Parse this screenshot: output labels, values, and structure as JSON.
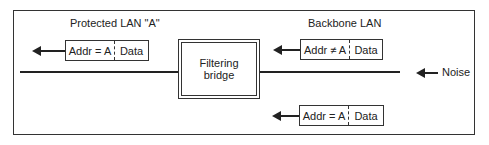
{
  "diagram": {
    "protected_lan_label": "Protected LAN \"A\"",
    "backbone_lan_label": "Backbone LAN",
    "bridge_label_line1": "Filtering",
    "bridge_label_line2": "bridge",
    "noise_label": "Noise",
    "packets": [
      {
        "addr": "Addr = A",
        "data": "Data",
        "location": "protected LAN, top-left"
      },
      {
        "addr": "Addr ≠ A",
        "data": "Data",
        "location": "backbone LAN, top-right"
      },
      {
        "addr": "Addr = A",
        "data": "Data",
        "location": "backbone LAN, bottom-right"
      }
    ]
  }
}
